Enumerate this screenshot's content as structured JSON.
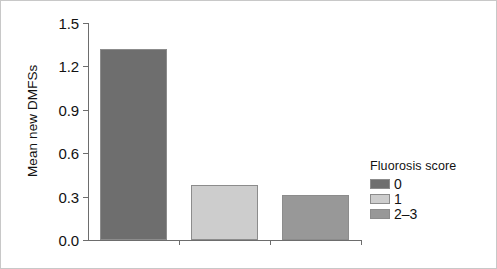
{
  "chart_data": {
    "type": "bar",
    "title": "",
    "xlabel": "",
    "ylabel": "Mean new DMFSs",
    "categories": [
      "0",
      "1",
      "2–3"
    ],
    "values": [
      1.32,
      0.38,
      0.31
    ],
    "ylim": [
      0.0,
      1.5
    ],
    "yticks": [
      "0.0",
      "0.3",
      "0.6",
      "0.9",
      "1.2",
      "1.5"
    ],
    "ytick_values": [
      0.0,
      0.3,
      0.6,
      0.9,
      1.2,
      1.5
    ],
    "grid": false,
    "legend_position": "right",
    "legend": {
      "title": "Fluorosis score",
      "entries": [
        {
          "label": "0",
          "color": "#6e6e6e"
        },
        {
          "label": "1",
          "color": "#cdcdcd"
        },
        {
          "label": "2–3",
          "color": "#989898"
        }
      ]
    },
    "bar_colors": [
      "#6e6e6e",
      "#cdcdcd",
      "#989898"
    ],
    "bar_edge_color": "#8c8c8c",
    "axis_color": "#6d6d6d",
    "text_color": "#121212",
    "frame_color": "#c8c8c8",
    "background": "#ffffff"
  }
}
